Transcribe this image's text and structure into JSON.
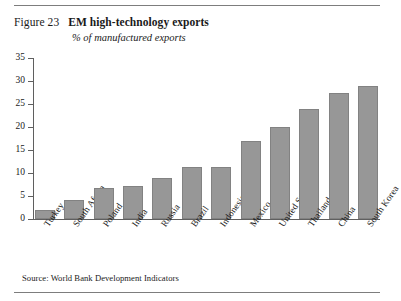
{
  "figure": {
    "number": "Figure 23",
    "title": "EM high-technology exports",
    "subtitle": "% of manufactured exports",
    "source": "Source: World Bank Development Indicators"
  },
  "chart_data": {
    "type": "bar",
    "title": "EM high-technology exports",
    "subtitle": "% of manufactured exports",
    "xlabel": "",
    "ylabel": "% of manufactured exports",
    "ylim": [
      0,
      35
    ],
    "ytick_step": 5,
    "yticks": [
      0,
      5,
      10,
      15,
      20,
      25,
      30,
      35
    ],
    "grid": false,
    "legend": false,
    "bar_color": "#979797",
    "bar_edge_color": "#828282",
    "categories": [
      "Turkey",
      "South Africa",
      "Poland",
      "India",
      "Russia",
      "Brazil",
      "Indonesia",
      "Mexico",
      "United States",
      "Thailand",
      "China",
      "South Korea"
    ],
    "values": [
      2,
      4.2,
      6.8,
      7.1,
      8.9,
      11.2,
      11.3,
      17,
      20,
      24,
      27.5,
      29
    ]
  }
}
